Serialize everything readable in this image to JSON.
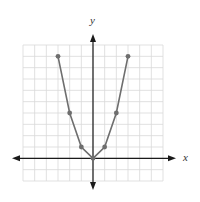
{
  "chart_data": {
    "type": "line",
    "title": "",
    "xlabel": "x",
    "ylabel": "y",
    "x": [
      -3,
      -2,
      -1,
      0,
      1,
      2,
      3
    ],
    "series": [
      {
        "name": "y = x^2",
        "values": [
          9,
          4,
          1,
          0,
          1,
          4,
          9
        ]
      }
    ],
    "xlim": [
      -6,
      6
    ],
    "ylim": [
      -2,
      10
    ],
    "grid": true,
    "legend": "none"
  },
  "colors": {
    "grid": "#d9d9d9",
    "axis": "#1a1a1a",
    "curve": "#6e6e6e",
    "point": "#6e6e6e"
  },
  "labels": {
    "x": "x",
    "y": "y"
  }
}
